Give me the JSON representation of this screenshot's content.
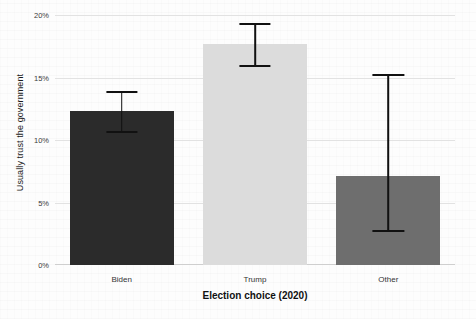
{
  "chart_data": {
    "type": "bar",
    "title": "",
    "xlabel": "Election choice (2020)",
    "ylabel": "Usually trust the government",
    "categories": [
      "Biden",
      "Trump",
      "Other"
    ],
    "values": [
      12.3,
      17.7,
      7.1
    ],
    "errors_low": [
      10.7,
      16.0,
      2.8
    ],
    "errors_high": [
      13.9,
      19.4,
      15.3
    ],
    "bar_colors": [
      "#2b2b2b",
      "#dcdcdc",
      "#6e6e6e"
    ],
    "ylim": [
      0,
      20
    ],
    "ytick_labels": [
      "0%",
      "5%",
      "10%",
      "15%",
      "20%"
    ],
    "ytick_values": [
      0,
      5,
      10,
      15,
      20
    ],
    "grid": true,
    "legend": "none",
    "units": "percent",
    "error_bar_style": "capped-vertical"
  }
}
